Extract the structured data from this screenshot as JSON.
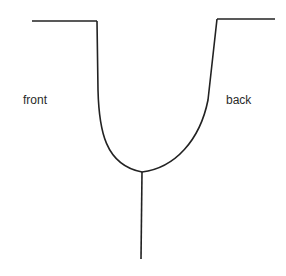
{
  "diagram": {
    "labels": {
      "left": "front",
      "right": "back"
    },
    "stroke_color": "#222222",
    "background": "#ffffff"
  }
}
